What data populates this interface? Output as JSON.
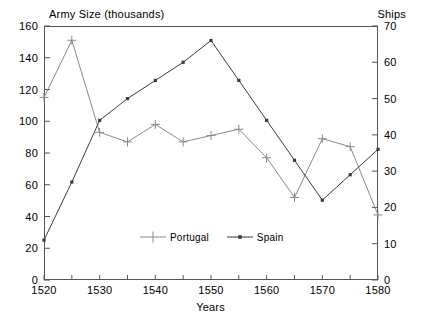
{
  "chart_data": {
    "type": "line",
    "title": "",
    "xlabel": "Years",
    "ylabel": "Army Size (thousands)",
    "y2label": "Ships",
    "x": [
      1520,
      1525,
      1530,
      1535,
      1540,
      1545,
      1550,
      1555,
      1560,
      1565,
      1570,
      1575,
      1580
    ],
    "xlim": [
      1520,
      1580
    ],
    "ylim": [
      0,
      160
    ],
    "y2lim": [
      0,
      70
    ],
    "xticks": [
      1520,
      1530,
      1540,
      1550,
      1560,
      1570,
      1580
    ],
    "xminorticks": [
      1525,
      1535,
      1545,
      1555,
      1565,
      1575
    ],
    "yticks": [
      0,
      20,
      40,
      60,
      80,
      100,
      120,
      140,
      160
    ],
    "y2ticks": [
      0,
      10,
      20,
      30,
      40,
      50,
      60,
      70
    ],
    "grid": false,
    "legend_position": "bottom-center",
    "series": [
      {
        "name": "Portugal",
        "axis": "left",
        "marker": "plus",
        "color": "#8a8a8a",
        "values": [
          115,
          151,
          93,
          87,
          98,
          87,
          91,
          95,
          77,
          52,
          89,
          84,
          41
        ]
      },
      {
        "name": "Spain",
        "axis": "right",
        "marker": "dot",
        "color": "#3b3b3b",
        "values": [
          11,
          27,
          44,
          50,
          55,
          60,
          66,
          55,
          44,
          33,
          22,
          29,
          36
        ]
      }
    ]
  },
  "axes": {
    "left_title": "Army Size (thousands)",
    "right_title": "Ships",
    "x_title": "Years"
  },
  "legend": {
    "entries": [
      {
        "label": "Portugal"
      },
      {
        "label": "Spain"
      }
    ]
  }
}
